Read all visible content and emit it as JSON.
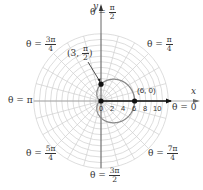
{
  "diagram": {
    "type": "polar-graph",
    "origin_px": [
      101,
      101
    ],
    "px_per_unit": 5.6,
    "grid": {
      "max_radius": 12,
      "radial_step": 1,
      "spoke_step_deg": 15,
      "color": "#cfcfcf"
    },
    "axes": {
      "x_label": "x",
      "y_label": "y"
    },
    "ticks": [
      "0",
      "2",
      "4",
      "6",
      "8",
      "10"
    ],
    "angle_labels": [
      {
        "id": "pi_over_2",
        "prefix": "θ =",
        "num": "π",
        "den": "2"
      },
      {
        "id": "pi_over_4",
        "prefix": "θ =",
        "num": "π",
        "den": "4"
      },
      {
        "id": "three_pi_over_4",
        "prefix": "θ =",
        "num": "3π",
        "den": "4"
      },
      {
        "id": "pi",
        "text": "θ = π"
      },
      {
        "id": "zero",
        "text": "θ = 0"
      },
      {
        "id": "five_pi_over_4",
        "prefix": "θ =",
        "num": "5π",
        "den": "4"
      },
      {
        "id": "seven_pi_over_4",
        "prefix": "θ =",
        "num": "7π",
        "den": "4"
      },
      {
        "id": "three_pi_over_2",
        "prefix": "θ =",
        "num": "3π",
        "den": "2"
      }
    ],
    "curve": {
      "equation": "r = 3 + 3cos θ",
      "color": "#8a8a8a"
    },
    "points": [
      {
        "label_open": "(",
        "label_r": "3,",
        "num": "π",
        "den": "2",
        "label_close": ")",
        "r": 3,
        "theta_deg": 90
      },
      {
        "label": "(6, 0)",
        "r": 6,
        "theta_deg": 0
      },
      {
        "label": "origin",
        "r": 0,
        "theta_deg": 0
      }
    ],
    "ray_end_units": 12.5
  }
}
